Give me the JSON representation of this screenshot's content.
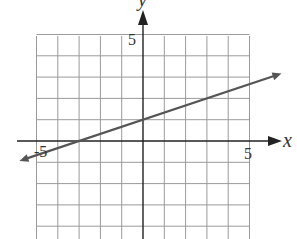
{
  "chart_data": {
    "type": "line",
    "title": "",
    "xlabel": "x",
    "ylabel": "y",
    "xlim": [
      -5,
      5
    ],
    "ylim": [
      -5,
      5
    ],
    "grid": true,
    "tick_labels": {
      "x": [
        "-5",
        "5"
      ],
      "y": [
        "5"
      ]
    },
    "series": [
      {
        "name": "line",
        "equation": "y = (1/3)x + 1",
        "slope": 0.3333,
        "y_intercept": 1,
        "x_intercept": -3,
        "points": [
          [
            -6,
            -1
          ],
          [
            -3,
            0
          ],
          [
            0,
            1
          ],
          [
            3,
            2
          ],
          [
            6,
            3
          ]
        ],
        "arrows_both_ends": true
      }
    ]
  },
  "labels": {
    "x_axis": "x",
    "y_axis": "y",
    "x_tick_neg": "-5",
    "x_tick_pos": "5",
    "y_tick_pos": "5"
  },
  "colors": {
    "grid": "#9a9a9a",
    "axis": "#222222",
    "line": "#555555"
  }
}
